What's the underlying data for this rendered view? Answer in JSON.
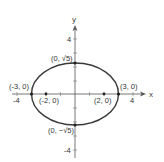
{
  "diagram": {
    "type": "ellipse-graph",
    "equation_implied": "x^2/9 + y^2/5 = 1",
    "axes": {
      "x_label": "x",
      "y_label": "y",
      "x_ticks": [
        "-4",
        "4"
      ],
      "y_ticks": [
        "4",
        "-4"
      ]
    },
    "points": [
      {
        "name": "vertex-left",
        "label": "(-3, 0)"
      },
      {
        "name": "vertex-right",
        "label": "(3, 0)"
      },
      {
        "name": "covertex-top",
        "label": "(0, √5)"
      },
      {
        "name": "covertex-bottom",
        "label": "(0, −√5)"
      },
      {
        "name": "focus-left",
        "label": "(-2, 0)"
      },
      {
        "name": "focus-right",
        "label": "(2, 0)"
      }
    ],
    "colors": {
      "curve": "#3a3a3a",
      "axes": "#555555",
      "text": "#333333"
    }
  }
}
